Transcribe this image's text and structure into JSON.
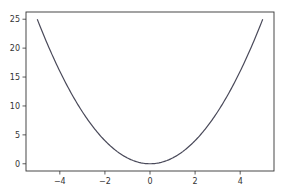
{
  "chart_data": {
    "type": "line",
    "title": "",
    "xlabel": "",
    "ylabel": "",
    "function": "y = x^2",
    "x_range": [
      -5,
      5
    ],
    "xlim": [
      -5.5,
      5.5
    ],
    "ylim": [
      -1.25,
      26.25
    ],
    "grid": false,
    "legend": null,
    "series": [
      {
        "name": "x^2",
        "color": "#4a4a5a",
        "x": [
          -5,
          -4.5,
          -4,
          -3.5,
          -3,
          -2.5,
          -2,
          -1.5,
          -1,
          -0.5,
          0,
          0.5,
          1,
          1.5,
          2,
          2.5,
          3,
          3.5,
          4,
          4.5,
          5
        ],
        "y": [
          25,
          20.25,
          16,
          12.25,
          9,
          6.25,
          4,
          2.25,
          1,
          0.25,
          0,
          0.25,
          1,
          2.25,
          4,
          6.25,
          9,
          12.25,
          16,
          20.25,
          25
        ]
      }
    ],
    "x_ticks": [
      -4,
      -2,
      0,
      2,
      4
    ],
    "x_tick_labels": [
      "−4",
      "−2",
      "0",
      "2",
      "4"
    ],
    "y_ticks": [
      0,
      5,
      10,
      15,
      20,
      25
    ],
    "y_tick_labels": [
      "0",
      "5",
      "10",
      "15",
      "20",
      "25"
    ]
  },
  "colors": {
    "axes": "#333333",
    "line": "#4a4a5a",
    "background": "#ffffff"
  }
}
